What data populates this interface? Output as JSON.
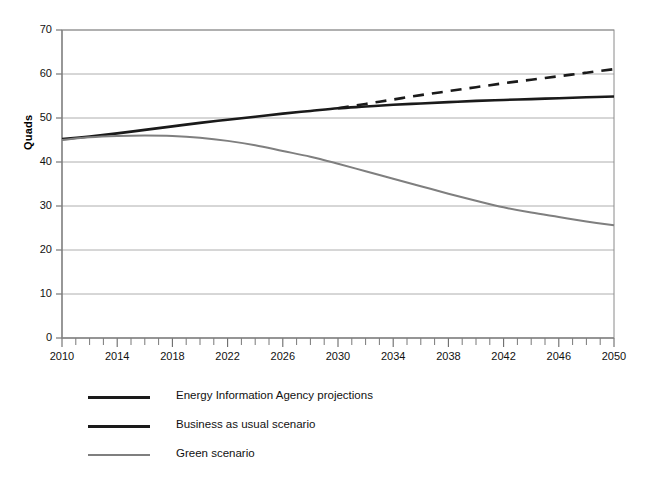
{
  "chart_data": {
    "type": "line",
    "title": "",
    "xlabel": "",
    "ylabel": "Quads",
    "xlim": [
      2010,
      2050
    ],
    "ylim": [
      0,
      70
    ],
    "ytick_step": 10,
    "xtick_major_step": 4,
    "xtick_minor_step": 1,
    "grid": true,
    "grid_axis": "y",
    "legend_position": "below-left",
    "ytick_labels": [
      "0",
      "10",
      "20",
      "30",
      "40",
      "50",
      "60",
      "70"
    ],
    "ytick_values": [
      0,
      10,
      20,
      30,
      40,
      50,
      60,
      70
    ],
    "xtick_labels": [
      "2010",
      "2014",
      "2018",
      "2022",
      "2026",
      "2030",
      "2034",
      "2038",
      "2042",
      "2046",
      "2050"
    ],
    "xtick_values": [
      2010,
      2014,
      2018,
      2022,
      2026,
      2030,
      2034,
      2038,
      2042,
      2046,
      2050
    ],
    "series": [
      {
        "name": "Energy Information Agency projections",
        "color": "#1a1a1a",
        "style": "dashed",
        "width": 2.6,
        "x": [
          2030,
          2032,
          2034,
          2036,
          2038,
          2040,
          2042,
          2044,
          2046,
          2048,
          2050
        ],
        "values": [
          52.2,
          53.2,
          54.2,
          55.2,
          56.1,
          57.0,
          57.9,
          58.7,
          59.5,
          60.3,
          61.1
        ]
      },
      {
        "name": "Business as usual scenario",
        "color": "#1a1a1a",
        "style": "solid",
        "width": 2.6,
        "x": [
          2010,
          2012,
          2014,
          2016,
          2018,
          2020,
          2022,
          2024,
          2026,
          2028,
          2030,
          2032,
          2034,
          2036,
          2038,
          2040,
          2042,
          2044,
          2046,
          2048,
          2050
        ],
        "values": [
          45.2,
          45.8,
          46.5,
          47.3,
          48.1,
          48.9,
          49.6,
          50.3,
          51.0,
          51.6,
          52.2,
          52.6,
          53.0,
          53.3,
          53.6,
          53.9,
          54.1,
          54.3,
          54.5,
          54.7,
          54.9
        ]
      },
      {
        "name": "Green scenario",
        "color": "#7f7f7f",
        "style": "solid",
        "width": 2.0,
        "x": [
          2010,
          2012,
          2014,
          2016,
          2018,
          2020,
          2022,
          2024,
          2026,
          2028,
          2030,
          2032,
          2034,
          2036,
          2038,
          2040,
          2042,
          2044,
          2046,
          2048,
          2050
        ],
        "values": [
          45.0,
          45.6,
          45.9,
          46.0,
          45.9,
          45.5,
          44.8,
          43.8,
          42.5,
          41.2,
          39.6,
          37.9,
          36.2,
          34.5,
          32.8,
          31.2,
          29.7,
          28.5,
          27.5,
          26.5,
          25.6
        ]
      }
    ]
  },
  "axes": {
    "y_title": "Quads"
  },
  "legend": {
    "items": [
      {
        "label": "Energy Information Agency projections",
        "color": "#1a1a1a",
        "style": "solid",
        "width": 3
      },
      {
        "label": "Business as usual scenario",
        "color": "#1a1a1a",
        "style": "solid",
        "width": 3
      },
      {
        "label": "Green scenario",
        "color": "#7f7f7f",
        "style": "solid",
        "width": 2.4
      }
    ]
  }
}
